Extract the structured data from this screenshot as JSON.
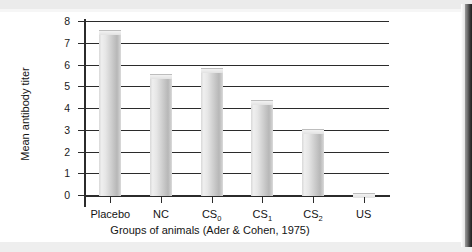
{
  "chart_data": {
    "type": "bar",
    "title": "",
    "xlabel": "Groups of animals (Ader & Cohen, 1975)",
    "ylabel": "Mean antibody titer",
    "categories": [
      "Placebo",
      "NC",
      "CS0",
      "CS1",
      "CS2",
      "US"
    ],
    "category_labels_display": [
      {
        "base": "Placebo",
        "sub": ""
      },
      {
        "base": "NC",
        "sub": ""
      },
      {
        "base": "CS",
        "sub": "0"
      },
      {
        "base": "CS",
        "sub": "1"
      },
      {
        "base": "CS",
        "sub": "2"
      },
      {
        "base": "US",
        "sub": ""
      }
    ],
    "values": [
      7.6,
      5.55,
      5.85,
      4.35,
      3.05,
      0.07
    ],
    "ylim": [
      0,
      8
    ],
    "ytick_labels": [
      "0",
      "1",
      "2",
      "3",
      "4",
      "5",
      "6",
      "7",
      "8"
    ],
    "ytick_values": [
      0,
      1,
      2,
      3,
      4,
      5,
      6,
      7,
      8
    ],
    "grid": "horizontal",
    "legend": "none",
    "bar_color": "#d3d3d3"
  },
  "figure": {
    "frame_color": "#2b2b2b",
    "background": "#ffffff"
  }
}
